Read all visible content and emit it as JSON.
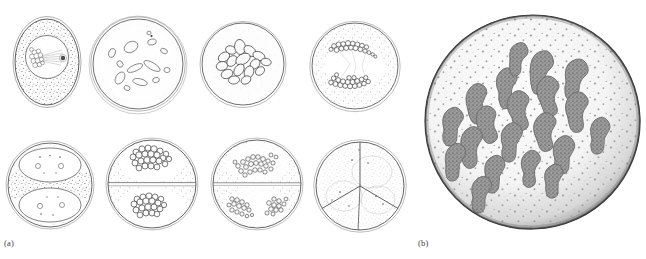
{
  "figure": {
    "background_color": "#ffffff",
    "ink_color": "#3a3a3a",
    "stipple_color": "#6e6e6e",
    "chromosome_fill": "#8d8d8d",
    "width_px": 646,
    "height_px": 259
  },
  "panels": [
    {
      "id": "a",
      "label": "(a)",
      "label_position": {
        "x": 4,
        "y": 238
      },
      "description": "Series of eight line drawings showing successive stages of cell division",
      "rows": 2,
      "columns": 4,
      "cells": [
        {
          "index": 1,
          "stage": "prophase",
          "shape": "ovoid",
          "center": {
            "x": 47,
            "y": 62
          },
          "radius_x": 33,
          "radius_y": 44,
          "nucleus": true,
          "nucleus_center": {
            "x": 47,
            "y": 57
          },
          "nucleus_radius": 22,
          "chromatin_clump": true,
          "spindle_visible": true,
          "cytoplasm_stipple": "dense",
          "caption_note": "Condensing chromatin mass with early spindle fibers inside a round nucleus"
        },
        {
          "index": 2,
          "stage": "prometaphase",
          "shape": "circle",
          "center": {
            "x": 138,
            "y": 64
          },
          "radius_x": 46,
          "radius_y": 46,
          "nucleus": false,
          "scattered_chromosomes": 12,
          "cytoplasm_stipple": "light",
          "caption_note": "Nuclear envelope dispersed; chromosomes scattered as outlined lozenges"
        },
        {
          "index": 3,
          "stage": "metaphase",
          "shape": "circle",
          "center": {
            "x": 243,
            "y": 64
          },
          "radius_x": 42,
          "radius_y": 42,
          "nucleus": false,
          "clustered_chromosomes": 16,
          "cytoplasm_stipple": "very-light",
          "caption_note": "Condensed chromosomes gathered in a central group"
        },
        {
          "index": 4,
          "stage": "anaphase",
          "shape": "circle",
          "center": {
            "x": 355,
            "y": 66
          },
          "radius_x": 44,
          "radius_y": 44,
          "nucleus": false,
          "chromosome_groups": 2,
          "group_positions": [
            "upper",
            "lower"
          ],
          "cytoplasm_stipple": "medium",
          "caption_note": "Two sister chromosome sets drawn apart toward opposite poles"
        },
        {
          "index": 5,
          "stage": "telophase",
          "shape": "circle",
          "center": {
            "x": 50,
            "y": 185
          },
          "radius_x": 43,
          "radius_y": 43,
          "daughter_nuclei": 2,
          "nucleoli_per_nucleus": 2,
          "cytoplasm_stipple": "dense-equator",
          "caption_note": "Two reconstituting daughter nuclei with nucleoli; dense cytoplasm band at the equator"
        },
        {
          "index": 6,
          "stage": "second-division prophase",
          "shape": "circle",
          "center": {
            "x": 152,
            "y": 184
          },
          "radius_x": 45,
          "radius_y": 45,
          "cell_plate": true,
          "chromosome_groups": 2,
          "cytoplasm_stipple": "medium",
          "caption_note": "Dyad separated by a cell plate; each half holds a compact chromosome cluster"
        },
        {
          "index": 7,
          "stage": "second-division anaphase",
          "shape": "circle",
          "center": {
            "x": 257,
            "y": 184
          },
          "radius_x": 45,
          "radius_y": 45,
          "cell_plate": true,
          "chromosome_groups": 3,
          "cytoplasm_stipple": "medium",
          "caption_note": "Upper half with one group, lower half with two separating groups"
        },
        {
          "index": 8,
          "stage": "tetrad / triad formation",
          "shape": "circle",
          "center": {
            "x": 360,
            "y": 186
          },
          "radius_x": 45,
          "radius_y": 45,
          "partitions": 3,
          "cytoplasm_stipple": "dense",
          "caption_note": "Cell partitioned into three compartments by intersecting walls"
        }
      ]
    },
    {
      "id": "b",
      "label": "(b)",
      "label_position": {
        "x": 418,
        "y": 238
      },
      "description": "Enlarged stippled drawing of a single cell showing individual V-shaped chromosomes",
      "cell": {
        "center": {
          "x": 533,
          "y": 122
        },
        "radius_x": 108,
        "radius_y": 107,
        "outline_tone": "dark-shaded-rim",
        "cytoplasm_stipple": "fine-speckled",
        "chromosome_count": 20,
        "chromosome_shape": "V-shaped and hooked, granular texture",
        "caption_note": "Detailed rendering of condensed chromosomes dispersed in the cell"
      }
    }
  ]
}
